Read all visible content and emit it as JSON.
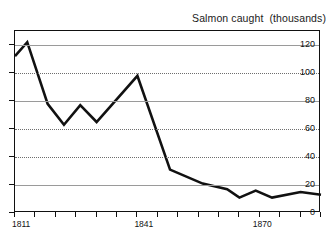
{
  "chart_data": {
    "type": "line",
    "title": "Salmon caught  (thousands)",
    "xlabel": "",
    "ylabel": "",
    "grid": true,
    "legend": null,
    "xlim": [
      1811,
      1886
    ],
    "ylim": [
      0,
      130
    ],
    "yticks": [
      0,
      20,
      40,
      60,
      80,
      100,
      120
    ],
    "ytick_labels": [
      "0",
      "20",
      "40",
      "60",
      "80",
      "100",
      "120"
    ],
    "xticks": [
      1811,
      1816,
      1821,
      1826,
      1831,
      1836,
      1841,
      1846,
      1851,
      1856,
      1861,
      1866,
      1871,
      1876,
      1881,
      1886
    ],
    "xtick_labels_shown": [
      "1811",
      "1841",
      "1870"
    ],
    "xtick_labels_shown_at": [
      1811,
      1841,
      1870
    ],
    "series_name": "Salmon caught (thousands)",
    "line_color": "#111111",
    "x": [
      1811,
      1814,
      1818,
      1822,
      1826,
      1830,
      1834,
      1838,
      1841,
      1845,
      1849,
      1853,
      1857,
      1861,
      1865,
      1869,
      1873,
      1877,
      1881,
      1886
    ],
    "values": [
      112,
      122,
      78,
      63,
      77,
      65,
      98,
      98,
      98,
      31,
      26,
      21,
      17,
      11,
      16,
      11,
      12,
      14,
      15,
      13
    ],
    "points": [
      {
        "x": 1811,
        "y": 112
      },
      {
        "x": 1814,
        "y": 122
      },
      {
        "x": 1819,
        "y": 78
      },
      {
        "x": 1823,
        "y": 63
      },
      {
        "x": 1827,
        "y": 77
      },
      {
        "x": 1831,
        "y": 65
      },
      {
        "x": 1841,
        "y": 98
      },
      {
        "x": 1849,
        "y": 31
      },
      {
        "x": 1857,
        "y": 21
      },
      {
        "x": 1863,
        "y": 17
      },
      {
        "x": 1866,
        "y": 11
      },
      {
        "x": 1870,
        "y": 16
      },
      {
        "x": 1874,
        "y": 11
      },
      {
        "x": 1881,
        "y": 15
      },
      {
        "x": 1886,
        "y": 13
      }
    ]
  },
  "axis": {
    "y_labels": [
      "120",
      "100",
      "80",
      "60",
      "40",
      "20",
      "0"
    ],
    "x_labels": [
      "1811",
      "1841",
      "1870"
    ]
  }
}
